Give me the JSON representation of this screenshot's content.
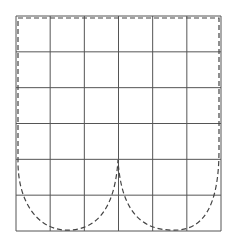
{
  "diagram": {
    "grid": {
      "columns": 6,
      "rows": 6,
      "left": 16,
      "top": 16,
      "right": 221,
      "bottom": 231,
      "line_color": "#555555"
    },
    "curve": {
      "style": "dashed",
      "color": "#444444",
      "description": "Dashed boundary running along top and side edges, descending into two U-shaped lobes at the bottom meeting at a central cusp",
      "cusp": {
        "x": 118,
        "y": 160
      },
      "lobes": 2
    }
  }
}
